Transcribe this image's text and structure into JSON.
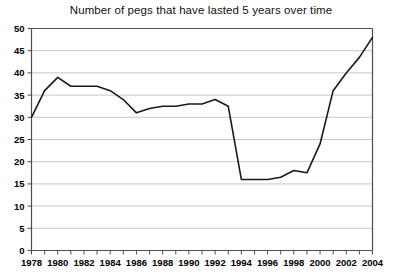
{
  "chart_data": {
    "type": "line",
    "title": "Number of pegs that have lasted 5 years over time",
    "xlabel": "",
    "ylabel": "",
    "xlim": [
      1978,
      2004
    ],
    "ylim": [
      0,
      50
    ],
    "ytick_step": 5,
    "xtick_step": 1,
    "xlabel_step": 2,
    "grid": true,
    "grid_axis": "y",
    "legend": false,
    "line_color": "#1a1a1a",
    "grid_color": "#c8c8c8",
    "axis_color": "#4d4d4d",
    "x": [
      1978,
      1979,
      1980,
      1981,
      1982,
      1983,
      1984,
      1985,
      1986,
      1987,
      1988,
      1989,
      1990,
      1991,
      1992,
      1993,
      1994,
      1995,
      1996,
      1997,
      1998,
      1999,
      2000,
      2001,
      2002,
      2003,
      2004
    ],
    "values": [
      30,
      36,
      39,
      37,
      37,
      37,
      36,
      34,
      31,
      32,
      32.5,
      32.5,
      33,
      33,
      34,
      32.5,
      16,
      16,
      16,
      16.5,
      18,
      17.5,
      24,
      36,
      40,
      43.5,
      48
    ],
    "ytick_labels": [
      "0",
      "5",
      "10",
      "15",
      "20",
      "25",
      "30",
      "35",
      "40",
      "45",
      "50"
    ],
    "ytick_values": [
      0,
      5,
      10,
      15,
      20,
      25,
      30,
      35,
      40,
      45,
      50
    ],
    "xtick_labels": [
      "1978",
      "1980",
      "1982",
      "1984",
      "1986",
      "1988",
      "1990",
      "1992",
      "1994",
      "1996",
      "1998",
      "2000",
      "2002",
      "2004"
    ],
    "xtick_label_values": [
      1978,
      1980,
      1982,
      1984,
      1986,
      1988,
      1990,
      1992,
      1994,
      1996,
      1998,
      2000,
      2002,
      2004
    ]
  }
}
